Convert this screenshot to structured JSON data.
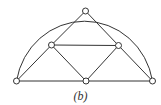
{
  "figure": {
    "caption": "(b)",
    "stroke_color": "#333333",
    "node_fill": "#ffffff",
    "node_radius": 3,
    "arc": {
      "from": "v_bl",
      "through": "v_top",
      "to": "v_br",
      "cx": 85,
      "cy": 81,
      "rx": 69,
      "ry": 72
    },
    "nodes": [
      {
        "id": "v_top",
        "x": 85.5,
        "y": 11
      },
      {
        "id": "v_ml",
        "x": 51.5,
        "y": 45
      },
      {
        "id": "v_mr",
        "x": 118.5,
        "y": 45.5
      },
      {
        "id": "v_bl",
        "x": 16.5,
        "y": 81
      },
      {
        "id": "v_bm",
        "x": 86,
        "y": 81
      },
      {
        "id": "v_br",
        "x": 152.5,
        "y": 81
      }
    ],
    "edges": [
      [
        "v_bl",
        "v_ml"
      ],
      [
        "v_ml",
        "v_top"
      ],
      [
        "v_top",
        "v_mr"
      ],
      [
        "v_mr",
        "v_br"
      ],
      [
        "v_ml",
        "v_mr"
      ],
      [
        "v_ml",
        "v_bm"
      ],
      [
        "v_mr",
        "v_bm"
      ],
      [
        "v_bl",
        "v_bm"
      ],
      [
        "v_bm",
        "v_br"
      ]
    ]
  }
}
